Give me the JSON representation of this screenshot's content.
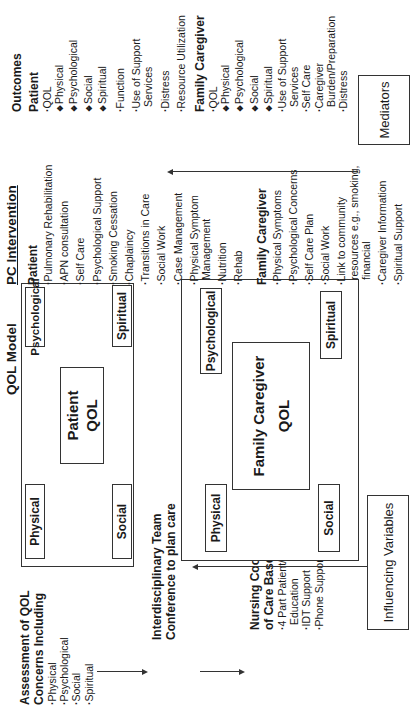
{
  "assessment": {
    "title_line1": "Assessment of QOL",
    "title_line2": "Concerns Including",
    "items": [
      "Physical",
      "Psychological",
      "Social",
      "Spiritual"
    ]
  },
  "idt": {
    "line1": "Interdisciplinary Team",
    "line2": "Conference to plan care"
  },
  "nursing": {
    "line1": "Nursing Coordination",
    "line2": "of Care Based on IDT",
    "items": [
      "4 Part Patient/Caregiver Education",
      "IDT Support",
      "Phone Support"
    ]
  },
  "qol_model": {
    "title": "QOL Model",
    "patient": {
      "center_line1": "Patient",
      "center_line2": "QOL",
      "domains": {
        "physical": "Physical",
        "psychological": "Psychological",
        "social": "Social",
        "spiritual": "Spiritual"
      }
    },
    "family": {
      "center_line1": "Family Caregiver",
      "center_line2": "QOL",
      "domains": {
        "physical": "Physical",
        "psychological": "Psychological",
        "social": "Social",
        "spiritual": "Spiritual"
      }
    }
  },
  "pc_intervention": {
    "title": "PC Intervention",
    "patient": {
      "heading": "Patient",
      "items": [
        "Pulmonary Rehabilitation",
        "APN consultation",
        "Self Care",
        "Psychological Support",
        "Smoking Cessation",
        "Chaplaincy",
        "Transitions in Care",
        "Social Work",
        "Case Management",
        "Physical Symptom Management",
        "Nutrition",
        "Rehab"
      ]
    },
    "family": {
      "heading": "Family Caregiver",
      "items": [
        "Physical Symptoms",
        "Psychological Concerns",
        "Self Care Plan",
        "Social Work",
        "Link to community resources e.g., smoking, financial",
        "Caregiver Information",
        "Spiritual Support"
      ]
    }
  },
  "outcomes": {
    "title": "Outcomes",
    "patient": {
      "heading": "Patient",
      "items": [
        {
          "text": "QOL",
          "type": "bullet"
        },
        {
          "text": "Physical",
          "type": "sub"
        },
        {
          "text": "Psychological",
          "type": "sub"
        },
        {
          "text": "Social",
          "type": "sub"
        },
        {
          "text": "Spiritual",
          "type": "sub"
        },
        {
          "text": "Function",
          "type": "bullet"
        },
        {
          "text": "Use of Support Services",
          "type": "bullet"
        },
        {
          "text": "Distress",
          "type": "bullet"
        },
        {
          "text": "Resource Utilization",
          "type": "bullet"
        }
      ]
    },
    "family": {
      "heading": "Family Caregiver",
      "items": [
        {
          "text": "QOL",
          "type": "bullet"
        },
        {
          "text": "Physical",
          "type": "sub"
        },
        {
          "text": "Psychological",
          "type": "sub"
        },
        {
          "text": "Social",
          "type": "sub"
        },
        {
          "text": "Spiritual",
          "type": "sub"
        },
        {
          "text": "Use of Support Services",
          "type": "bullet"
        },
        {
          "text": "Self Care",
          "type": "bullet"
        },
        {
          "text": "Caregiver Burden/Preparation",
          "type": "bullet"
        },
        {
          "text": "Distress",
          "type": "bullet"
        }
      ]
    }
  },
  "influencing_variables": "Influencing Variables",
  "mediators": "Mediators",
  "colors": {
    "line": "#333333",
    "text": "#1a1a1a",
    "background": "#ffffff"
  }
}
